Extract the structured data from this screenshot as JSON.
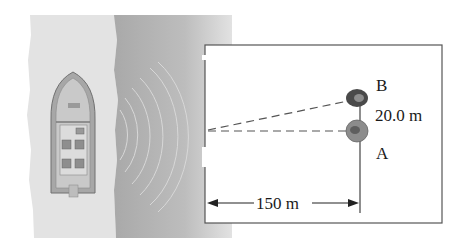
{
  "figure": {
    "labels": {
      "point_b": "B",
      "point_a": "A",
      "separation": "20.0 m",
      "distance": "150 m"
    },
    "colors": {
      "shore": "#e4e4e4",
      "water": "#b4b4b4",
      "box_line": "#555555",
      "rock_b": "#4a4a4a",
      "rock_a": "#8a8a8a",
      "boat_hull": "#9a9a9a"
    },
    "elements": {
      "boat": "boat-top-view",
      "waves": "sound-wave-arcs",
      "rocks": [
        "A",
        "B"
      ],
      "dashed_lines": 2,
      "dimension_arrow": "150 m"
    }
  }
}
